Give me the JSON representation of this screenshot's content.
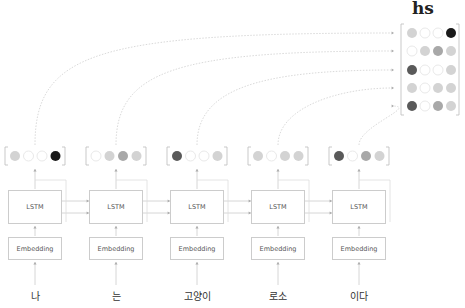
{
  "title": "hs",
  "module_labels": {
    "lstm": "LSTM",
    "embedding": "Embedding"
  },
  "tokens": [
    "나",
    "는",
    "고양이",
    "로소",
    "이다"
  ],
  "colors": {
    "c0": "#ffffff",
    "c1": "#d3d3d3",
    "c2": "#a8a8a8",
    "c3": "#5a5a5a",
    "c4": "#1a1a1a",
    "line": "#cfcfcf"
  },
  "hidden_vectors": [
    [
      1,
      0,
      0,
      4
    ],
    [
      0,
      1,
      2,
      1
    ],
    [
      3,
      0,
      0,
      1
    ],
    [
      1,
      0,
      1,
      1
    ],
    [
      3,
      0,
      2,
      1
    ]
  ],
  "hs_matrix": [
    [
      1,
      0,
      0,
      4
    ],
    [
      0,
      1,
      2,
      1
    ],
    [
      3,
      0,
      0,
      1
    ],
    [
      1,
      0,
      1,
      1
    ],
    [
      3,
      0,
      2,
      1
    ]
  ]
}
